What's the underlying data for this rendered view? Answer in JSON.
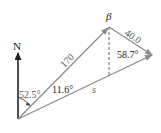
{
  "diagram": {
    "north_label": "N",
    "vector_a_label": "170",
    "vector_b_label": "40.0",
    "resultant_label": "s",
    "angle_north": "52.5°",
    "angle_between": "11.6°",
    "angle_right": "58.7°",
    "angle_beta": "β"
  },
  "colors": {
    "vector": "#8a8a8a",
    "north_arrow": "#222222",
    "text": "#5a5a5a"
  }
}
